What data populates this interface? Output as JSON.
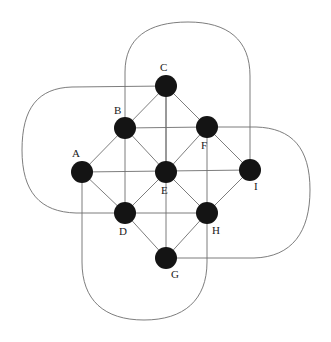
{
  "figure": {
    "title": "",
    "background_color": "#ffffff",
    "node_color": "#141414",
    "node_radius": 11,
    "edge_color": "#6e6e6e",
    "edge_width": 0.9,
    "label_color": "#1a1a1a",
    "label_font_size": 11
  },
  "nodes": [
    {
      "id": "A",
      "label": "A",
      "x": 82,
      "y": 172,
      "label_x": 72,
      "label_y": 157
    },
    {
      "id": "B",
      "label": "B",
      "x": 125,
      "y": 128,
      "label_x": 114,
      "label_y": 114
    },
    {
      "id": "C",
      "label": "C",
      "x": 166,
      "y": 86,
      "label_x": 160,
      "label_y": 71
    },
    {
      "id": "D",
      "label": "D",
      "x": 125,
      "y": 213,
      "label_x": 119,
      "label_y": 235
    },
    {
      "id": "E",
      "label": "E",
      "x": 166,
      "y": 172,
      "label_x": 161,
      "label_y": 194
    },
    {
      "id": "F",
      "label": "F",
      "x": 207,
      "y": 127,
      "label_x": 201,
      "label_y": 149
    },
    {
      "id": "G",
      "label": "G",
      "x": 166,
      "y": 258,
      "label_x": 171,
      "label_y": 278
    },
    {
      "id": "H",
      "label": "H",
      "x": 207,
      "y": 213,
      "label_x": 212,
      "label_y": 234
    },
    {
      "id": "I",
      "label": "I",
      "x": 250,
      "y": 170,
      "label_x": 254,
      "label_y": 190
    }
  ],
  "straight_edges": [
    {
      "from": "A",
      "to": "B"
    },
    {
      "from": "A",
      "to": "E"
    },
    {
      "from": "A",
      "to": "D"
    },
    {
      "from": "B",
      "to": "C"
    },
    {
      "from": "B",
      "to": "E"
    },
    {
      "from": "B",
      "to": "F"
    },
    {
      "from": "B",
      "to": "D"
    },
    {
      "from": "C",
      "to": "E"
    },
    {
      "from": "C",
      "to": "F"
    },
    {
      "from": "D",
      "to": "E"
    },
    {
      "from": "D",
      "to": "G"
    },
    {
      "from": "D",
      "to": "H"
    },
    {
      "from": "E",
      "to": "F"
    },
    {
      "from": "E",
      "to": "G"
    },
    {
      "from": "E",
      "to": "H"
    },
    {
      "from": "E",
      "to": "I"
    },
    {
      "from": "F",
      "to": "H"
    },
    {
      "from": "F",
      "to": "I"
    },
    {
      "from": "G",
      "to": "H"
    },
    {
      "from": "H",
      "to": "I"
    }
  ],
  "vertical_run_edges": [
    {
      "from": "C",
      "to": "G",
      "axis": "vertical",
      "x": 166
    },
    {
      "from": "B",
      "to": "D",
      "axis": "vertical",
      "x": 125
    },
    {
      "from": "F",
      "to": "H",
      "axis": "vertical",
      "x": 207
    }
  ],
  "horizontal_run_edges": [
    {
      "from": "A",
      "to": "I",
      "axis": "horizontal",
      "y": 172
    },
    {
      "from": "B",
      "to": "F",
      "axis": "horizontal",
      "y": 128
    },
    {
      "from": "D",
      "to": "H",
      "axis": "horizontal",
      "y": 213
    }
  ],
  "wrap_edges": [
    {
      "id": "wrap-left",
      "from": "C",
      "to": "D",
      "side": "left",
      "extent": 22
    },
    {
      "id": "wrap-top",
      "from": "B",
      "to": "I",
      "side": "top",
      "extent": 22
    },
    {
      "id": "wrap-right",
      "from": "F",
      "to": "G",
      "side": "right",
      "extent": 310
    },
    {
      "id": "wrap-bottom",
      "from": "A",
      "to": "H",
      "side": "bottom",
      "extent": 320
    }
  ]
}
